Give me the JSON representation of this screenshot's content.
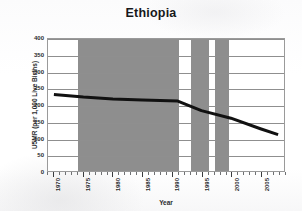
{
  "chart_data": {
    "type": "line",
    "title": "Ethiopia",
    "xlabel": "Year",
    "ylabel": "U5MR (per 1,000 Live Births)",
    "xlim": [
      1969,
      2009
    ],
    "ylim": [
      0,
      400
    ],
    "grid": true,
    "legend": "none",
    "y_ticks": [
      0,
      50,
      100,
      150,
      200,
      250,
      300,
      350,
      400
    ],
    "y_tick_labels": [
      "0",
      "50",
      "100",
      "150",
      "200",
      "250",
      "300",
      "350",
      "400"
    ],
    "x_ticks": [
      1970,
      1975,
      1980,
      1985,
      1990,
      1995,
      2000,
      2005
    ],
    "x_tick_labels": [
      "1970",
      "1975",
      "1980",
      "1985",
      "1990",
      "1995",
      "2000",
      "2005"
    ],
    "x_minor_tick_step": 1,
    "series": [
      {
        "name": "U5MR",
        "color": "#111111",
        "x": [
          1970,
          1975,
          1980,
          1985,
          1991,
          1995,
          2000,
          2005,
          2008
        ],
        "values": [
          232,
          224,
          218,
          215,
          212,
          183,
          160,
          128,
          110
        ]
      }
    ],
    "shaded_bands": [
      {
        "label": "conflict-band-1",
        "start": 1974,
        "end": 1991,
        "color": "#8e8e8e"
      },
      {
        "label": "conflict-band-2",
        "start": 1993,
        "end": 1996,
        "color": "#8e8e8e"
      },
      {
        "label": "conflict-band-3",
        "start": 1997,
        "end": 1999.5,
        "color": "#8e8e8e"
      }
    ],
    "band_color": "#8e8e8e",
    "plot_background": "#ffffff",
    "gridline_color": "#8f8f8f",
    "frame_color": "#9a9a9a"
  }
}
